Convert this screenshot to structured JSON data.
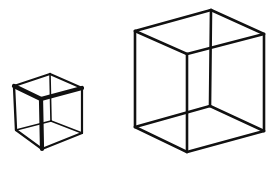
{
  "diagram": {
    "type": "necker-cube-pair",
    "background": "#ffffff",
    "stroke_color": "#111111",
    "cubes": [
      {
        "id": "small-cube",
        "label": "small cube",
        "stroke_width": 2.4,
        "vertices": {
          "tb": [
            50,
            74
          ],
          "tl": [
            14,
            86
          ],
          "tr": [
            82,
            88
          ],
          "tf": [
            41,
            99
          ],
          "bl": [
            16,
            130
          ],
          "bb": [
            51,
            121
          ],
          "br": [
            82,
            133
          ],
          "bf": [
            42,
            149
          ]
        },
        "edges": [
          {
            "from": "tb",
            "to": "tl",
            "w": 2.2
          },
          {
            "from": "tb",
            "to": "tr",
            "w": 2.2
          },
          {
            "from": "tl",
            "to": "tf",
            "w": 4.2
          },
          {
            "from": "tf",
            "to": "tr",
            "w": 4.2
          },
          {
            "from": "tl",
            "to": "bl",
            "w": 2.4
          },
          {
            "from": "tr",
            "to": "br",
            "w": 2.2
          },
          {
            "from": "tf",
            "to": "bf",
            "w": 4.2
          },
          {
            "from": "tb",
            "to": "bb",
            "w": 1.6
          },
          {
            "from": "bl",
            "to": "bb",
            "w": 1.8
          },
          {
            "from": "bb",
            "to": "br",
            "w": 1.8
          },
          {
            "from": "bl",
            "to": "bf",
            "w": 2.2
          },
          {
            "from": "bf",
            "to": "br",
            "w": 2.2
          }
        ]
      },
      {
        "id": "large-cube",
        "label": "large cube",
        "stroke_width": 2.6,
        "vertices": {
          "tb": [
            211,
            10
          ],
          "tl": [
            135,
            31
          ],
          "tr": [
            264,
            34
          ],
          "tf": [
            187,
            54
          ],
          "bl": [
            135,
            127
          ],
          "bb": [
            210,
            106
          ],
          "br": [
            264,
            131
          ],
          "bf": [
            187,
            152
          ]
        },
        "edges": [
          {
            "from": "tb",
            "to": "tl",
            "w": 2.6
          },
          {
            "from": "tb",
            "to": "tr",
            "w": 2.6
          },
          {
            "from": "tl",
            "to": "tf",
            "w": 2.6
          },
          {
            "from": "tf",
            "to": "tr",
            "w": 2.6
          },
          {
            "from": "tl",
            "to": "bl",
            "w": 2.6
          },
          {
            "from": "tr",
            "to": "br",
            "w": 2.6
          },
          {
            "from": "tf",
            "to": "bf",
            "w": 2.6
          },
          {
            "from": "tb",
            "to": "bb",
            "w": 2.6
          },
          {
            "from": "bl",
            "to": "bb",
            "w": 2.6
          },
          {
            "from": "bb",
            "to": "br",
            "w": 2.6
          },
          {
            "from": "bl",
            "to": "bf",
            "w": 2.6
          },
          {
            "from": "bf",
            "to": "br",
            "w": 2.6
          }
        ]
      }
    ]
  }
}
